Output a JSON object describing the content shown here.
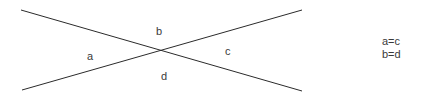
{
  "diagram": {
    "background_color": "#ffffff",
    "line_color": "#2b2b2b",
    "text_color": "#3a3a3a",
    "line_width": 1,
    "lines": [
      {
        "name": "line-descending",
        "x1": 21,
        "y1": 10,
        "x2": 302,
        "y2": 91
      },
      {
        "name": "line-ascending",
        "x1": 22,
        "y1": 90,
        "x2": 302,
        "y2": 10
      }
    ],
    "intersection": {
      "x": 162,
      "y": 51
    },
    "angle_labels": [
      {
        "id": "a",
        "text": "a",
        "position": "left",
        "x": 90,
        "y": 56
      },
      {
        "id": "b",
        "text": "b",
        "position": "top",
        "x": 159,
        "y": 31
      },
      {
        "id": "c",
        "text": "c",
        "position": "right",
        "x": 228,
        "y": 51
      },
      {
        "id": "d",
        "text": "d",
        "position": "bottom",
        "x": 164,
        "y": 76
      }
    ]
  },
  "annotations": {
    "equations": [
      "a=c",
      "b=d"
    ]
  }
}
